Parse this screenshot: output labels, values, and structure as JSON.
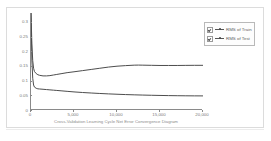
{
  "caption": "Cross-Validation Learning Cycle Net Error Convergence Diagram",
  "legend": {
    "items": [
      {
        "label": "RMS of Train",
        "checked": true,
        "checkbox_icon": "checkbox-checked-icon",
        "marker_icon": "line-marker-icon"
      },
      {
        "label": "RMS of Test",
        "checked": true,
        "checkbox_icon": "checkbox-checked-icon",
        "marker_icon": "line-marker-icon"
      }
    ]
  },
  "axes": {
    "y_ticks": [
      "0.3",
      "0.25",
      "0.2",
      "0.15",
      "0.1",
      "0.05",
      "0"
    ],
    "x_ticks": [
      "0",
      "5,000",
      "10,000",
      "15,000",
      "20,000"
    ]
  },
  "colors": {
    "train_line": "#4d4d4d",
    "test_line": "#4d4d4d",
    "axis": "#8a8a8a",
    "frame": "#dcdcdc",
    "text": "#7a7a7a",
    "background": "#ffffff"
  },
  "chart_data": {
    "type": "line",
    "title": "",
    "subtitle": "",
    "xlabel": "Cross-Validation Learning Cycle Net Error Convergence Diagram",
    "ylabel": "",
    "xlim": [
      0,
      20000
    ],
    "ylim": [
      0,
      0.33
    ],
    "grid": false,
    "legend_position": "right-top",
    "x_tick_values": [
      0,
      5000,
      10000,
      15000,
      20000
    ],
    "y_tick_values": [
      0,
      0.05,
      0.1,
      0.15,
      0.2,
      0.25,
      0.3
    ],
    "series": [
      {
        "name": "RMS of Test",
        "x": [
          0,
          100,
          200,
          300,
          400,
          600,
          800,
          1000,
          1400,
          1800,
          2200,
          2600,
          3000,
          3600,
          4200,
          5000,
          6000,
          7000,
          8000,
          9000,
          10000,
          11000,
          12000,
          12500,
          13000,
          14000,
          15000,
          16000,
          17000,
          18000,
          19000,
          20000
        ],
        "y": [
          0.332,
          0.225,
          0.168,
          0.142,
          0.131,
          0.124,
          0.12,
          0.118,
          0.116,
          0.116,
          0.117,
          0.119,
          0.121,
          0.124,
          0.127,
          0.13,
          0.134,
          0.138,
          0.142,
          0.146,
          0.149,
          0.151,
          0.1525,
          0.1528,
          0.1525,
          0.152,
          0.1515,
          0.1515,
          0.1515,
          0.1518,
          0.152,
          0.152
        ]
      },
      {
        "name": "RMS of Train",
        "x": [
          0,
          100,
          200,
          300,
          400,
          600,
          800,
          1000,
          1400,
          1800,
          2200,
          2600,
          3000,
          3600,
          4200,
          5000,
          6000,
          7000,
          8000,
          9000,
          10000,
          11000,
          12000,
          13000,
          14000,
          15000,
          16000,
          17000,
          18000,
          19000,
          20000
        ],
        "y": [
          0.332,
          0.17,
          0.108,
          0.085,
          0.078,
          0.074,
          0.072,
          0.0715,
          0.0705,
          0.0695,
          0.0685,
          0.0675,
          0.0665,
          0.065,
          0.0635,
          0.0615,
          0.0595,
          0.0578,
          0.0562,
          0.0548,
          0.0536,
          0.0525,
          0.0516,
          0.0508,
          0.0501,
          0.0495,
          0.049,
          0.0486,
          0.0483,
          0.0481,
          0.048
        ]
      }
    ]
  }
}
